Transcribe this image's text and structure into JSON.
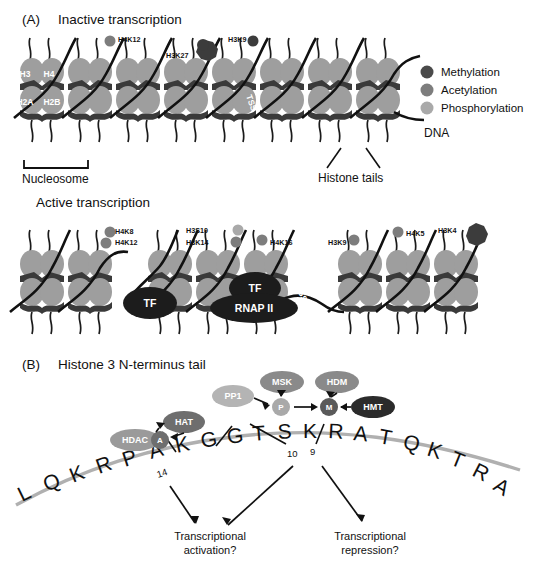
{
  "figure": {
    "panels": [
      {
        "tag": "(A)",
        "title": "Inactive transcription",
        "subtitle": "Active transcription"
      },
      {
        "tag": "(B)",
        "title": "Histone 3 N-terminus tail"
      }
    ]
  },
  "legend": {
    "items": [
      {
        "label": "Methylation",
        "color": "#4a4a4a"
      },
      {
        "label": "Acetylation",
        "color": "#7d7d7d"
      },
      {
        "label": "Phosphorylation",
        "color": "#a9a9a9"
      }
    ]
  },
  "panel_a": {
    "tag": "(A)",
    "inactive_title": "Inactive transcription",
    "active_title": "Active transcription",
    "dna_label": "DNA",
    "nucleosome_label": "Nucleosome",
    "histone_tails_label": "Histone tails",
    "tss_label": "TSS",
    "core_labels": [
      "H3",
      "H4",
      "H2A",
      "H2B"
    ],
    "inactive_marks": [
      {
        "label": "H4K12",
        "type": "Acetylation",
        "color": "#7d7d7d"
      },
      {
        "label": "H3K27",
        "type": "Methylation",
        "color": "#3c3c3c"
      },
      {
        "label": "H3K9",
        "type": "Methylation",
        "color": "#3c3c3c"
      }
    ],
    "active_marks": [
      {
        "label": "H4K8",
        "type": "Acetylation",
        "color": "#7d7d7d"
      },
      {
        "label": "H4K12",
        "type": "Acetylation",
        "color": "#7d7d7d"
      },
      {
        "label": "H3S10",
        "type": "Phosphorylation",
        "color": "#a9a9a9"
      },
      {
        "label": "H3K14",
        "type": "Acetylation",
        "color": "#7d7d7d"
      },
      {
        "label": "H4K16",
        "type": "Acetylation",
        "color": "#7d7d7d"
      },
      {
        "label": "H3K9",
        "type": "Acetylation",
        "color": "#7d7d7d"
      },
      {
        "label": "H4K5",
        "type": "Acetylation",
        "color": "#7d7d7d"
      },
      {
        "label": "H3K4",
        "type": "Methylation",
        "color": "#3c3c3c"
      }
    ],
    "complexes": [
      {
        "label": "TF"
      },
      {
        "label": "TF"
      },
      {
        "label": "RNAP II"
      }
    ]
  },
  "panel_b": {
    "tag": "(B)",
    "title": "Histone 3 N-terminus tail",
    "sequence": [
      "L",
      "Q",
      "K",
      "R",
      "P",
      "A",
      "K",
      "G",
      "G",
      "T",
      "S",
      "K",
      "R",
      "A",
      "T",
      "Q",
      "K",
      "T",
      "R",
      "A"
    ],
    "position_numbers": [
      "14",
      "10",
      "9"
    ],
    "modifications": [
      {
        "label": "A",
        "name": "acetyl",
        "color": "#6e6e6e"
      },
      {
        "label": "P",
        "name": "phospho",
        "color": "#a9a9a9"
      },
      {
        "label": "M",
        "name": "methyl",
        "color": "#5a5a5a"
      }
    ],
    "enzymes": [
      {
        "label": "HDAC",
        "color": "#9a9a9a"
      },
      {
        "label": "HAT",
        "color": "#6e6e6e"
      },
      {
        "label": "PP1",
        "color": "#b4b4b4"
      },
      {
        "label": "MSK",
        "color": "#8a8a8a"
      },
      {
        "label": "HDM",
        "color": "#8a8a8a"
      },
      {
        "label": "HMT",
        "color": "#2b2b2b"
      }
    ],
    "outcomes": [
      {
        "line1": "Transcriptional",
        "line2": "activation?"
      },
      {
        "line1": "Transcriptional",
        "line2": "repression?"
      }
    ]
  },
  "colors": {
    "histone_body": "#9e9e9e",
    "histone_dark": "#3a3a3a",
    "dna_strand": "#111111",
    "sequence_wave": "#b0b0b0"
  }
}
